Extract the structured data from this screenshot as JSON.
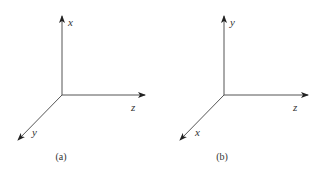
{
  "panels": [
    {
      "id": "a",
      "caption": "(a)",
      "axes": {
        "vertical": {
          "label": "x"
        },
        "horizontal": {
          "label": "z"
        },
        "diagonal": {
          "label": "y"
        }
      }
    },
    {
      "id": "b",
      "caption": "(b)",
      "axes": {
        "vertical": {
          "label": "y"
        },
        "horizontal": {
          "label": "z"
        },
        "diagonal": {
          "label": "x"
        }
      }
    }
  ],
  "colors": {
    "axis_line": "#444444",
    "label_text": "#333333",
    "background": "#ffffff"
  }
}
